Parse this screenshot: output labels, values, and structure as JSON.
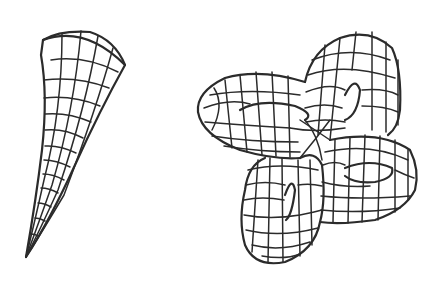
{
  "figure": {
    "background": "#ffffff",
    "ink_color": "#2b2b2b",
    "panels": [
      {
        "name": "horn-surface",
        "description": "Tapered curved horn wireframe surface (pseudosphere-like)",
        "grid": {
          "meridians": 6,
          "parallels": 12
        }
      },
      {
        "name": "four-lobed-surface",
        "description": "Self-intersecting four-lobed wireframe surface",
        "lobes": 4
      }
    ]
  }
}
